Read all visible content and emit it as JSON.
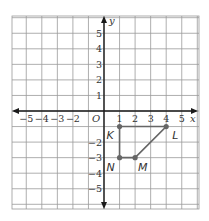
{
  "diagram": {
    "type": "coordinate-plane",
    "x_axis": {
      "label": "x",
      "min": -5,
      "max": 5,
      "tick_labels": [
        "-5",
        "-4",
        "-3",
        "-2",
        "1",
        "2",
        "3",
        "4",
        "5"
      ]
    },
    "y_axis": {
      "label": "y",
      "min": -5,
      "max": 5,
      "tick_labels": [
        "5",
        "4",
        "3",
        "2",
        "1",
        "-2",
        "-3",
        "-4",
        "-5"
      ]
    },
    "origin_label": "O",
    "grid": {
      "columns": 12,
      "color": "#9a9a9a"
    },
    "quadrilateral": {
      "name": "KLMN",
      "color": "#666666",
      "vertices": [
        {
          "label": "K",
          "x": 1,
          "y": -1
        },
        {
          "label": "L",
          "x": 4,
          "y": -1
        },
        {
          "label": "M",
          "x": 2,
          "y": -3
        },
        {
          "label": "N",
          "x": 1,
          "y": -3
        }
      ]
    }
  }
}
